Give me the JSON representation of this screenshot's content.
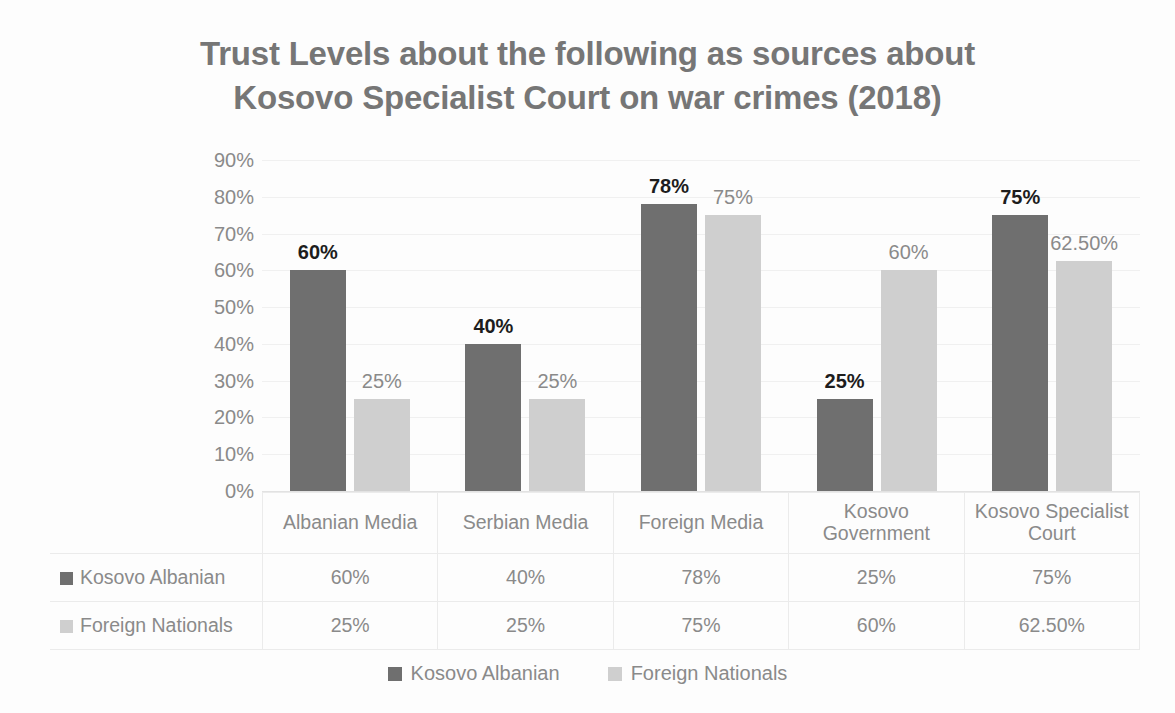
{
  "title": {
    "line1": "Trust Levels about the following as sources about",
    "line2": "Kosovo Specialist Court on war crimes (2018)"
  },
  "colors": {
    "series0": "#6f6f6f",
    "series1": "#cfcfcf",
    "title": "#767676",
    "axis_text": "#8a8a8a",
    "gridline": "#f0f0f0"
  },
  "legend": {
    "items": [
      {
        "label": "Kosovo Albanian",
        "swatch": "series0"
      },
      {
        "label": "Foreign Nationals",
        "swatch": "series1"
      }
    ]
  },
  "axis": {
    "y_ticks": [
      "90%",
      "80%",
      "70%",
      "60%",
      "50%",
      "40%",
      "30%",
      "20%",
      "10%",
      "0%"
    ]
  },
  "table": {
    "corner": "",
    "headers": [
      "Albanian Media",
      "Serbian Media",
      "Foreign Media",
      "Kosovo Government",
      "Kosovo Specialist Court"
    ],
    "rows": [
      {
        "label": "Kosovo Albanian",
        "swatch": "series0",
        "cells": [
          "60%",
          "40%",
          "78%",
          "25%",
          "75%"
        ]
      },
      {
        "label": "Foreign Nationals",
        "swatch": "series1",
        "cells": [
          "25%",
          "25%",
          "75%",
          "60%",
          "62.50%"
        ]
      }
    ]
  },
  "chart_data": {
    "type": "bar",
    "title": "Trust Levels about the following as sources about Kosovo Specialist Court on war crimes (2018)",
    "xlabel": "",
    "ylabel": "",
    "ylim": [
      0,
      90
    ],
    "ytick_step": 10,
    "grid": true,
    "legend_position": "bottom",
    "categories": [
      "Albanian Media",
      "Serbian Media",
      "Foreign Media",
      "Kosovo Government",
      "Kosovo Specialist Court"
    ],
    "series": [
      {
        "name": "Kosovo Albanian",
        "color": "#6f6f6f",
        "values": [
          60,
          40,
          78,
          25,
          75
        ],
        "labels": [
          "60%",
          "40%",
          "78%",
          "25%",
          "75%"
        ]
      },
      {
        "name": "Foreign Nationals",
        "color": "#cfcfcf",
        "values": [
          25,
          25,
          75,
          60,
          62.5
        ],
        "labels": [
          "25%",
          "25%",
          "75%",
          "60%",
          "62.50%"
        ]
      }
    ]
  }
}
